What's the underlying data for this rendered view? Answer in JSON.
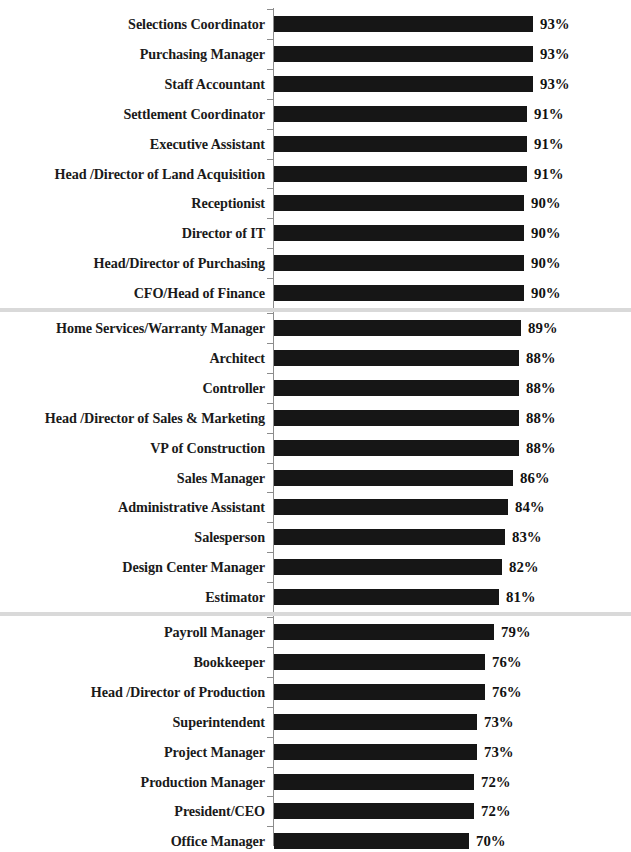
{
  "chart_data": {
    "type": "bar",
    "orientation": "horizontal",
    "title": "",
    "xlabel": "",
    "ylabel": "",
    "value_suffix": "%",
    "xlim": [
      0,
      100
    ],
    "grid": false,
    "legend": false,
    "bar_color": "#161616",
    "separator_color": "#d9d9d9",
    "axis_color": "#8c8c8c",
    "label_color": "#1a1a1a",
    "categories": [
      "Selections Coordinator",
      "Purchasing Manager",
      "Staff Accountant",
      "Settlement Coordinator",
      "Executive Assistant",
      "Head /Director of Land Acquisition",
      "Receptionist",
      "Director of IT",
      "Head/Director of Purchasing",
      "CFO/Head of Finance",
      "Home Services/Warranty Manager",
      "Architect",
      "Controller",
      "Head /Director of Sales & Marketing",
      "VP of Construction",
      "Sales Manager",
      "Administrative Assistant",
      "Salesperson",
      "Design Center Manager",
      "Estimator",
      "Payroll Manager",
      "Bookkeeper",
      "Head /Director of Production",
      "Superintendent",
      "Project Manager",
      "Production Manager",
      "President/CEO",
      "Office Manager"
    ],
    "values": [
      93,
      93,
      93,
      91,
      91,
      91,
      90,
      90,
      90,
      90,
      89,
      88,
      88,
      88,
      88,
      86,
      84,
      83,
      82,
      81,
      79,
      76,
      76,
      73,
      73,
      72,
      72,
      70
    ],
    "value_labels": [
      "93%",
      "93%",
      "93%",
      "91%",
      "91%",
      "91%",
      "90%",
      "90%",
      "90%",
      "90%",
      "89%",
      "88%",
      "88%",
      "88%",
      "88%",
      "86%",
      "84%",
      "83%",
      "82%",
      "81%",
      "79%",
      "76%",
      "76%",
      "73%",
      "73%",
      "72%",
      "72%",
      "70%"
    ],
    "group_separators_after": [
      9,
      19
    ]
  }
}
